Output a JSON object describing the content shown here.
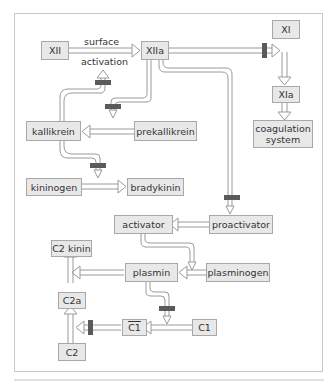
{
  "diagram": {
    "title_cropped": "",
    "labels": {
      "surface": "surface",
      "activation": "activation"
    },
    "nodes": {
      "xii": "XII",
      "xiia": "XIIa",
      "xi": "XI",
      "xia": "XIa",
      "coagulation": "coagulation\nsystem",
      "kallikrein": "kallikrein",
      "prekallikrein": "prekallikrein",
      "kininogen": "kininogen",
      "bradykinin": "bradykinin",
      "activator": "activator",
      "proactivator": "proactivator",
      "plasmin": "plasmin",
      "plasminogen": "plasminogen",
      "c2kinin": "C2 kinin",
      "c2a": "C2a",
      "c2": "C2",
      "c1bar": "C1",
      "c1": "C1"
    },
    "edges": [
      {
        "from": "XII",
        "to": "XIIa",
        "label": "surface activation"
      },
      {
        "from": "XIIa",
        "to": "XI",
        "inhibitor_mark": true
      },
      {
        "from": "XI",
        "to": "XIa"
      },
      {
        "from": "XIa",
        "to": "coagulation system"
      },
      {
        "from": "kallikrein",
        "to": "XII/XIIa activation",
        "inhibitor_mark": true
      },
      {
        "from": "XIIa",
        "to": "prekallikrein→kallikrein",
        "inhibitor_mark": true
      },
      {
        "from": "prekallikrein",
        "to": "kallikrein"
      },
      {
        "from": "kallikrein",
        "to": "kininogen→bradykinin",
        "inhibitor_mark": true
      },
      {
        "from": "kininogen",
        "to": "bradykinin"
      },
      {
        "from": "XIIa",
        "to": "proactivator→activator",
        "inhibitor_mark": true
      },
      {
        "from": "proactivator",
        "to": "activator"
      },
      {
        "from": "activator",
        "to": "plasminogen→plasmin"
      },
      {
        "from": "plasminogen",
        "to": "plasmin"
      },
      {
        "from": "plasmin",
        "to": "C2a→C2 kinin"
      },
      {
        "from": "plasmin",
        "to": "C1→C1 bar",
        "inhibitor_mark": true
      },
      {
        "from": "C1",
        "to": "C1 bar"
      },
      {
        "from": "C1 bar",
        "to": "C2→C2a",
        "inhibitor_mark": true
      },
      {
        "from": "C2",
        "to": "C2a"
      },
      {
        "from": "C2a",
        "to": "C2 kinin"
      }
    ],
    "colors": {
      "node_fill": "#e8e8e8",
      "node_border": "#a8a8a8",
      "connector": "#9a9a9a",
      "inhibitor_bar": "#555555",
      "frame": "#c8c8c8"
    }
  }
}
